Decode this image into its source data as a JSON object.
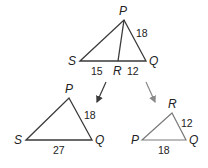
{
  "colors": {
    "background": "#ffffff",
    "line_dark": "#3a3a3a",
    "line_light": "#7a7a7a",
    "text": "#222222"
  },
  "top_triangle": {
    "vertices": {
      "P": "P",
      "S": "S",
      "Q": "Q",
      "R": "R"
    },
    "sides": {
      "PQ": "18",
      "SR": "15",
      "RQ": "12"
    }
  },
  "left_triangle": {
    "vertices": {
      "P": "P",
      "S": "S",
      "Q": "Q"
    },
    "sides": {
      "PQ": "18",
      "SQ": "27"
    }
  },
  "right_triangle": {
    "vertices": {
      "R": "R",
      "P": "P",
      "Q": "Q"
    },
    "sides": {
      "RQ": "12",
      "PQ": "18"
    }
  }
}
